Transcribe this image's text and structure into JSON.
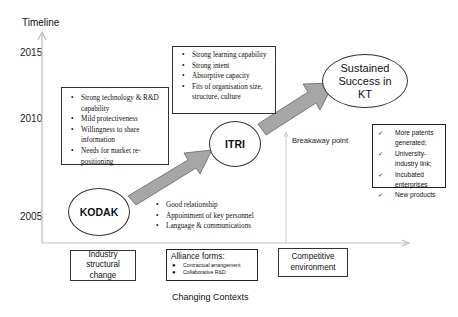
{
  "axis": {
    "y_label": "Timeline",
    "years": [
      "2015",
      "2010",
      "2005"
    ],
    "x_label": "Changing Contexts",
    "line_color": "#bdbdbd"
  },
  "kodak_box": {
    "items": [
      "Strong technology & R&D capability",
      "Mild protectiveness",
      "Willingness to share information",
      "Needs for market re-positioning"
    ]
  },
  "itri_box": {
    "items": [
      "Strong learning capability",
      "Strong intent",
      "Absorptive capacity",
      "Fits of organisation size, structure, culture"
    ]
  },
  "alliance_box": {
    "items": [
      "Good relationship",
      "Appointment of key personnel",
      "Language & communications"
    ]
  },
  "nodes": {
    "kodak": "KODAK",
    "itri": "ITRI",
    "success": "Sustained Success in KT"
  },
  "breakaway_label": "Breakaway point",
  "outcomes": {
    "items": [
      "More patents generated;",
      "University-industry link;",
      "Incubated enterprises",
      "New products"
    ]
  },
  "contexts": {
    "industry": "Industry structural change",
    "alliance_title": "Alliance forms:",
    "alliance_items": [
      "Contractual arrangement",
      "Collaborative R&D"
    ],
    "competitive": "Competitive environment"
  },
  "colors": {
    "arrow_fill": "#a6a6a6",
    "arrow_stroke": "#666666",
    "border": "#333333"
  }
}
